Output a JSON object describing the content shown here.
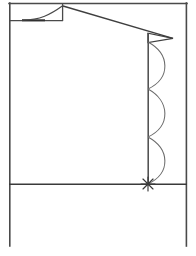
{
  "document": {
    "title": "Line drawing",
    "description": "Monochrome technical sketch: rectangular frame, small inset box with rising curve at upper left, peaked apex with diagonal jib terminating in an arrowhead, vertical mast with three right-bulging arcs, asterisk burst at mast base, horizontal ground line."
  },
  "canvas": {
    "width": 196,
    "height": 256,
    "background": "#ffffff"
  },
  "style": {
    "stroke": "#4a4a4a",
    "stroke_dark": "#3a3a3a",
    "stroke_light": "#6f6f6f",
    "fill": "none",
    "frame_stroke_width": 1.6,
    "line_stroke_width": 1.3,
    "arc_stroke_width": 1.0
  },
  "geometry": {
    "frame": {
      "name": "outer-frame",
      "left_x": 9,
      "right_x": 187,
      "top_y": 3,
      "bottom_y": 246
    },
    "ground_line": {
      "name": "ground-line",
      "y": 184,
      "x1": 9,
      "x2": 187
    },
    "inset_box": {
      "name": "inset-box",
      "x1": 9,
      "y1": 3,
      "x2": 63,
      "y2": 21
    },
    "inset_curve": {
      "name": "rising-curve",
      "start": [
        22,
        20
      ],
      "control_1": [
        40,
        20
      ],
      "control_2": [
        50,
        14
      ],
      "end": [
        63,
        5
      ]
    },
    "inset_baseline": {
      "name": "inset-baseline",
      "x1": 22,
      "x2": 44,
      "y": 20
    },
    "apex": {
      "name": "apex-point",
      "x": 63,
      "y": 6
    },
    "jib_line": {
      "name": "jib-diagonal",
      "from": [
        63,
        6
      ],
      "to": [
        172,
        38
      ]
    },
    "arrow_head": {
      "name": "arrowhead",
      "tip": [
        172,
        38
      ],
      "base_top": [
        148,
        33
      ],
      "base_bottom": [
        148,
        42
      ]
    },
    "mast": {
      "name": "vertical-mast",
      "x": 148,
      "y_top": 33,
      "y_bottom": 184
    },
    "arcs": [
      {
        "name": "mast-arc-1",
        "y_start": 42,
        "y_end": 89,
        "bulge_x": 172
      },
      {
        "name": "mast-arc-2",
        "y_start": 89,
        "y_end": 137,
        "bulge_x": 172
      },
      {
        "name": "mast-arc-3",
        "y_start": 137,
        "y_end": 184,
        "bulge_x": 172
      }
    ],
    "burst": {
      "name": "asterisk-burst",
      "center": [
        148,
        184
      ],
      "radius": 7,
      "ray_count": 8
    }
  }
}
